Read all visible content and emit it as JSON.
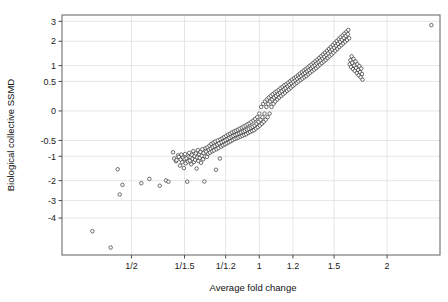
{
  "figure": {
    "background_color": "#ffffff",
    "plot_border_color": "#6e6e6e",
    "gridline_color": "#e3e3e3",
    "point_stroke_color": "#1b1b1b",
    "point_fill_color": "#ffffff"
  },
  "chart_data": {
    "type": "scatter",
    "title": "",
    "xlabel": "Average fold change",
    "ylabel": "Biological collective SSMD",
    "grid": true,
    "legend": null,
    "x_tick_labels": [
      "1/2",
      "1/1.5",
      "1/1.2",
      "1",
      "1.2",
      "1.5",
      "2"
    ],
    "x_tick_values": [
      -0.6931,
      -0.4055,
      -0.1823,
      0.0,
      0.1823,
      0.4055,
      0.6931
    ],
    "y_tick_labels": [
      "3",
      "2",
      "1",
      "0.5",
      "0",
      "-0.5",
      "-1",
      "-2",
      "-3",
      "-4"
    ],
    "y_tick_values": [
      3,
      2,
      1,
      0.5,
      0,
      -0.5,
      -1,
      -2,
      -3,
      -4
    ],
    "xlim": [
      -1.07,
      0.98
    ],
    "ylim": [
      -6.45,
      3.35
    ],
    "x_scale": "log-fold-change",
    "y_scale": "signed-sqrt",
    "n_points": 303,
    "points": [
      [
        -0.905,
        -4.82
      ],
      [
        -0.806,
        -5.92
      ],
      [
        -0.768,
        -1.5
      ],
      [
        -0.757,
        -2.68
      ],
      [
        -0.742,
        -2.2
      ],
      [
        -0.64,
        -2.12
      ],
      [
        -0.596,
        -1.92
      ],
      [
        -0.54,
        -2.24
      ],
      [
        -0.506,
        -1.99
      ],
      [
        -0.493,
        -2.05
      ],
      [
        -0.468,
        -0.86
      ],
      [
        -0.462,
        -1.08
      ],
      [
        -0.452,
        -1.18
      ],
      [
        -0.449,
        -1.14
      ],
      [
        -0.441,
        -0.97
      ],
      [
        -0.436,
        -1.02
      ],
      [
        -0.43,
        -1.35
      ],
      [
        -0.426,
        -1.12
      ],
      [
        -0.423,
        -0.94
      ],
      [
        -0.418,
        -1.22
      ],
      [
        -0.414,
        -1.05
      ],
      [
        -0.409,
        -1.45
      ],
      [
        -0.405,
        -1.1
      ],
      [
        -0.402,
        -0.92
      ],
      [
        -0.399,
        -1.26
      ],
      [
        -0.395,
        -1.07
      ],
      [
        -0.391,
        -2.05
      ],
      [
        -0.387,
        -1.19
      ],
      [
        -0.383,
        -1.01
      ],
      [
        -0.38,
        -0.88
      ],
      [
        -0.377,
        -1.16
      ],
      [
        -0.373,
        -1.03
      ],
      [
        -0.369,
        -1.3
      ],
      [
        -0.366,
        -0.95
      ],
      [
        -0.362,
        -1.09
      ],
      [
        -0.358,
        -0.82
      ],
      [
        -0.355,
        -1.21
      ],
      [
        -0.351,
        -0.99
      ],
      [
        -0.348,
        -1.13
      ],
      [
        -0.344,
        -0.9
      ],
      [
        -0.34,
        -1.47
      ],
      [
        -0.337,
        -1.04
      ],
      [
        -0.333,
        -0.79
      ],
      [
        -0.33,
        -1.17
      ],
      [
        -0.326,
        -0.93
      ],
      [
        -0.323,
        -1.06
      ],
      [
        -0.319,
        -0.85
      ],
      [
        -0.316,
        -1.24
      ],
      [
        -0.312,
        -0.98
      ],
      [
        -0.309,
        -0.76
      ],
      [
        -0.305,
        -1.11
      ],
      [
        -0.302,
        -0.89
      ],
      [
        -0.298,
        -2.04
      ],
      [
        -0.295,
        -1.0
      ],
      [
        -0.291,
        -0.73
      ],
      [
        -0.288,
        -0.84
      ],
      [
        -0.284,
        -1.02
      ],
      [
        -0.281,
        -0.7
      ],
      [
        -0.277,
        -0.91
      ],
      [
        -0.274,
        -0.78
      ],
      [
        -0.27,
        -0.65
      ],
      [
        -0.267,
        -0.87
      ],
      [
        -0.263,
        -0.74
      ],
      [
        -0.26,
        -0.6
      ],
      [
        -0.256,
        -0.83
      ],
      [
        -0.253,
        -0.69
      ],
      [
        -0.249,
        -0.56
      ],
      [
        -0.246,
        -0.8
      ],
      [
        -0.242,
        -0.66
      ],
      [
        -0.239,
        -0.53
      ],
      [
        -0.235,
        -1.52
      ],
      [
        -0.232,
        -0.76
      ],
      [
        -0.228,
        -0.62
      ],
      [
        -0.225,
        -0.5
      ],
      [
        -0.221,
        -0.72
      ],
      [
        -0.218,
        -0.58
      ],
      [
        -0.214,
        -1.08
      ],
      [
        -0.211,
        -0.47
      ],
      [
        -0.207,
        -0.68
      ],
      [
        -0.204,
        -0.55
      ],
      [
        -0.2,
        -0.44
      ],
      [
        -0.197,
        -0.64
      ],
      [
        -0.193,
        -0.52
      ],
      [
        -0.19,
        -0.41
      ],
      [
        -0.186,
        -0.61
      ],
      [
        -0.183,
        -0.49
      ],
      [
        -0.179,
        -0.38
      ],
      [
        -0.176,
        -0.58
      ],
      [
        -0.172,
        -0.46
      ],
      [
        -0.169,
        -0.35
      ],
      [
        -0.165,
        -0.55
      ],
      [
        -0.162,
        -0.43
      ],
      [
        -0.158,
        -0.33
      ],
      [
        -0.155,
        -0.52
      ],
      [
        -0.151,
        -0.4
      ],
      [
        -0.148,
        -0.3
      ],
      [
        -0.144,
        -0.49
      ],
      [
        -0.141,
        -0.38
      ],
      [
        -0.137,
        -0.28
      ],
      [
        -0.134,
        -0.46
      ],
      [
        -0.13,
        -0.36
      ],
      [
        -0.127,
        -0.26
      ],
      [
        -0.123,
        -0.44
      ],
      [
        -0.12,
        -0.34
      ],
      [
        -0.116,
        -0.24
      ],
      [
        -0.113,
        -0.42
      ],
      [
        -0.109,
        -0.32
      ],
      [
        -0.106,
        -0.22
      ],
      [
        -0.102,
        -0.4
      ],
      [
        -0.099,
        -0.3
      ],
      [
        -0.095,
        -0.2
      ],
      [
        -0.092,
        -0.38
      ],
      [
        -0.088,
        -0.28
      ],
      [
        -0.085,
        -0.18
      ],
      [
        -0.081,
        -0.36
      ],
      [
        -0.078,
        -0.26
      ],
      [
        -0.074,
        -0.16
      ],
      [
        -0.071,
        -0.34
      ],
      [
        -0.067,
        -0.24
      ],
      [
        -0.064,
        -0.14
      ],
      [
        -0.06,
        -0.31
      ],
      [
        -0.057,
        -0.22
      ],
      [
        -0.053,
        -0.12
      ],
      [
        -0.05,
        -0.29
      ],
      [
        -0.046,
        -0.2
      ],
      [
        -0.043,
        -0.1
      ],
      [
        -0.039,
        -0.27
      ],
      [
        -0.036,
        -0.18
      ],
      [
        -0.032,
        -0.08
      ],
      [
        -0.029,
        -0.25
      ],
      [
        -0.025,
        -0.16
      ],
      [
        -0.022,
        -0.06
      ],
      [
        -0.018,
        -0.22
      ],
      [
        -0.015,
        -0.13
      ],
      [
        -0.011,
        -0.04
      ],
      [
        -0.008,
        -0.19
      ],
      [
        -0.004,
        -0.1
      ],
      [
        0.0,
        -0.01
      ],
      [
        0.003,
        -0.16
      ],
      [
        0.007,
        -0.07
      ],
      [
        0.01,
        0.02
      ],
      [
        0.014,
        -0.13
      ],
      [
        0.017,
        -0.04
      ],
      [
        0.021,
        0.05
      ],
      [
        0.024,
        -0.1
      ],
      [
        0.028,
        -0.01
      ],
      [
        0.031,
        0.08
      ],
      [
        0.035,
        -0.07
      ],
      [
        0.038,
        0.02
      ],
      [
        0.042,
        0.11
      ],
      [
        0.045,
        -0.04
      ],
      [
        0.049,
        0.05
      ],
      [
        0.052,
        0.14
      ],
      [
        0.056,
        -0.01
      ],
      [
        0.059,
        0.08
      ],
      [
        0.063,
        0.17
      ],
      [
        0.066,
        0.02
      ],
      [
        0.07,
        0.11
      ],
      [
        0.073,
        0.2
      ],
      [
        0.077,
        0.05
      ],
      [
        0.08,
        0.14
      ],
      [
        0.084,
        0.23
      ],
      [
        0.087,
        0.08
      ],
      [
        0.091,
        0.17
      ],
      [
        0.094,
        0.26
      ],
      [
        0.098,
        0.11
      ],
      [
        0.101,
        0.2
      ],
      [
        0.105,
        0.29
      ],
      [
        0.108,
        0.14
      ],
      [
        0.112,
        0.23
      ],
      [
        0.115,
        0.33
      ],
      [
        0.119,
        0.17
      ],
      [
        0.122,
        0.26
      ],
      [
        0.126,
        0.36
      ],
      [
        0.129,
        0.2
      ],
      [
        0.133,
        0.3
      ],
      [
        0.136,
        0.4
      ],
      [
        0.14,
        0.23
      ],
      [
        0.143,
        0.33
      ],
      [
        0.147,
        0.43
      ],
      [
        0.15,
        0.27
      ],
      [
        0.154,
        0.37
      ],
      [
        0.157,
        0.47
      ],
      [
        0.161,
        0.3
      ],
      [
        0.164,
        0.41
      ],
      [
        0.168,
        0.51
      ],
      [
        0.171,
        0.34
      ],
      [
        0.175,
        0.45
      ],
      [
        0.178,
        0.55
      ],
      [
        0.182,
        0.38
      ],
      [
        0.185,
        0.49
      ],
      [
        0.189,
        0.59
      ],
      [
        0.192,
        0.42
      ],
      [
        0.196,
        0.53
      ],
      [
        0.199,
        0.63
      ],
      [
        0.203,
        0.46
      ],
      [
        0.206,
        0.57
      ],
      [
        0.21,
        0.68
      ],
      [
        0.213,
        0.5
      ],
      [
        0.217,
        0.62
      ],
      [
        0.22,
        0.73
      ],
      [
        0.224,
        0.54
      ],
      [
        0.227,
        0.66
      ],
      [
        0.231,
        0.78
      ],
      [
        0.234,
        0.58
      ],
      [
        0.238,
        0.71
      ],
      [
        0.241,
        0.83
      ],
      [
        0.245,
        0.62
      ],
      [
        0.248,
        0.75
      ],
      [
        0.252,
        0.88
      ],
      [
        0.255,
        0.66
      ],
      [
        0.259,
        0.8
      ],
      [
        0.262,
        0.93
      ],
      [
        0.266,
        0.71
      ],
      [
        0.269,
        0.85
      ],
      [
        0.273,
        0.99
      ],
      [
        0.276,
        0.76
      ],
      [
        0.28,
        0.9
      ],
      [
        0.283,
        1.04
      ],
      [
        0.287,
        0.81
      ],
      [
        0.29,
        0.96
      ],
      [
        0.294,
        1.1
      ],
      [
        0.297,
        0.86
      ],
      [
        0.301,
        1.01
      ],
      [
        0.304,
        1.16
      ],
      [
        0.308,
        0.91
      ],
      [
        0.311,
        1.07
      ],
      [
        0.315,
        1.22
      ],
      [
        0.318,
        0.97
      ],
      [
        0.322,
        1.13
      ],
      [
        0.325,
        1.29
      ],
      [
        0.329,
        1.03
      ],
      [
        0.332,
        1.19
      ],
      [
        0.336,
        1.36
      ],
      [
        0.339,
        1.09
      ],
      [
        0.343,
        1.26
      ],
      [
        0.346,
        1.43
      ],
      [
        0.35,
        1.15
      ],
      [
        0.353,
        1.33
      ],
      [
        0.357,
        1.5
      ],
      [
        0.36,
        1.21
      ],
      [
        0.364,
        1.4
      ],
      [
        0.367,
        1.58
      ],
      [
        0.371,
        1.28
      ],
      [
        0.374,
        1.47
      ],
      [
        0.378,
        1.66
      ],
      [
        0.381,
        1.35
      ],
      [
        0.385,
        1.55
      ],
      [
        0.388,
        1.74
      ],
      [
        0.392,
        1.42
      ],
      [
        0.395,
        1.63
      ],
      [
        0.399,
        1.83
      ],
      [
        0.402,
        1.5
      ],
      [
        0.406,
        1.71
      ],
      [
        0.409,
        1.92
      ],
      [
        0.413,
        1.58
      ],
      [
        0.416,
        1.8
      ],
      [
        0.42,
        2.01
      ],
      [
        0.424,
        1.66
      ],
      [
        0.427,
        1.89
      ],
      [
        0.431,
        2.1
      ],
      [
        0.434,
        1.74
      ],
      [
        0.438,
        1.98
      ],
      [
        0.441,
        2.19
      ],
      [
        0.445,
        1.82
      ],
      [
        0.448,
        2.07
      ],
      [
        0.452,
        2.28
      ],
      [
        0.455,
        1.9
      ],
      [
        0.459,
        2.16
      ],
      [
        0.462,
        2.37
      ],
      [
        0.466,
        1.98
      ],
      [
        0.469,
        2.25
      ],
      [
        0.473,
        2.46
      ],
      [
        0.476,
        2.06
      ],
      [
        0.48,
        2.34
      ],
      [
        0.483,
        2.55
      ],
      [
        0.487,
        2.14
      ],
      [
        0.49,
        1.05
      ],
      [
        0.494,
        1.2
      ],
      [
        0.497,
        0.95
      ],
      [
        0.501,
        1.35
      ],
      [
        0.504,
        1.1
      ],
      [
        0.508,
        0.88
      ],
      [
        0.511,
        1.25
      ],
      [
        0.515,
        1.0
      ],
      [
        0.518,
        0.82
      ],
      [
        0.522,
        1.15
      ],
      [
        0.525,
        0.92
      ],
      [
        0.529,
        0.75
      ],
      [
        0.532,
        1.05
      ],
      [
        0.536,
        0.85
      ],
      [
        0.539,
        0.68
      ],
      [
        0.543,
        0.98
      ],
      [
        0.546,
        0.78
      ],
      [
        0.55,
        0.62
      ],
      [
        0.553,
        0.9
      ],
      [
        0.557,
        0.72
      ],
      [
        0.56,
        0.55
      ],
      [
        0.933,
        2.8
      ]
    ]
  }
}
